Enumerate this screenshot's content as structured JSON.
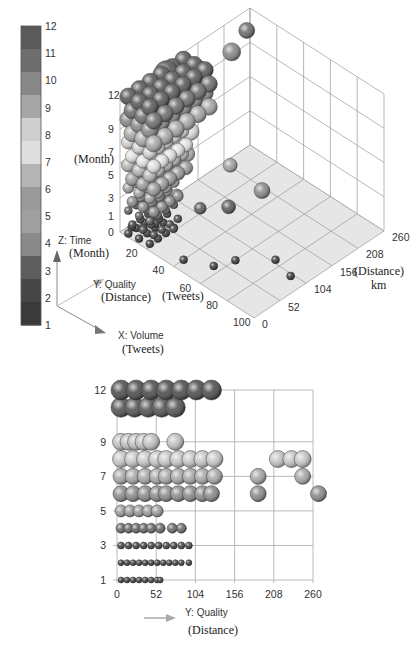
{
  "chart_data": [
    {
      "type": "scatter",
      "subtype": "3d-bubble",
      "title": "",
      "axes": {
        "x": {
          "name": "X: Volume",
          "unit_label": "(Tweets)",
          "ticks": [
            20,
            40,
            60,
            80,
            100
          ],
          "range": [
            0,
            100
          ]
        },
        "y": {
          "name": "Y: Quality",
          "unit_label": "(Distance)",
          "tick_unit": "km",
          "ticks": [
            0,
            52,
            104,
            156,
            208,
            260
          ],
          "range": [
            0,
            260
          ]
        },
        "z": {
          "name": "Z: Time",
          "unit_label": "(Month)",
          "ticks": [
            0,
            1,
            3,
            5,
            7,
            9,
            12
          ],
          "range": [
            0,
            12
          ]
        }
      },
      "axis_tick_labels": {
        "z": [
          "12",
          "9",
          "7",
          "5",
          "3",
          "1",
          "0"
        ],
        "x": [
          "20",
          "40",
          "60",
          "80",
          "100"
        ],
        "y": [
          "0",
          "52",
          "104",
          "156",
          "208",
          "260"
        ]
      },
      "legend": {
        "type": "colorbar",
        "position": "left",
        "ticks": [
          "12",
          "11",
          "10",
          "9",
          "8",
          "7",
          "6",
          "5",
          "4",
          "3",
          "2",
          "1"
        ],
        "colors": [
          "#5a5a5a",
          "#6e6e6e",
          "#888888",
          "#a6a6a6",
          "#cfcfcf",
          "#dedede",
          "#b4b4b4",
          "#9a9a9a",
          "#a0a0a0",
          "#8a8a8a",
          "#5e5e5e",
          "#464646",
          "#3a3a3a"
        ]
      },
      "grid": true,
      "points_approx": [
        {
          "x": 5,
          "y": 10,
          "z": 0.5,
          "size": 4
        },
        {
          "x": 10,
          "y": 20,
          "z": 0.5,
          "size": 4
        },
        {
          "x": 15,
          "y": 30,
          "z": 1,
          "size": 4
        },
        {
          "x": 25,
          "y": 40,
          "z": 1,
          "size": 4
        },
        {
          "x": 40,
          "y": 20,
          "z": 0,
          "size": 4
        },
        {
          "x": 55,
          "y": 40,
          "z": 0,
          "size": 4
        },
        {
          "x": 60,
          "y": 70,
          "z": 0,
          "size": 4
        },
        {
          "x": 75,
          "y": 110,
          "z": 0,
          "size": 4
        },
        {
          "x": 90,
          "y": 100,
          "z": 0,
          "size": 4
        },
        {
          "x": 10,
          "y": 30,
          "z": 3,
          "size": 6
        },
        {
          "x": 20,
          "y": 60,
          "z": 3,
          "size": 6
        },
        {
          "x": 30,
          "y": 80,
          "z": 2,
          "size": 6
        },
        {
          "x": 40,
          "y": 110,
          "z": 2,
          "size": 7
        },
        {
          "x": 50,
          "y": 150,
          "z": 3,
          "size": 8
        },
        {
          "x": 30,
          "y": 140,
          "z": 4,
          "size": 7
        },
        {
          "x": 15,
          "y": 50,
          "z": 5,
          "size": 8
        },
        {
          "x": 20,
          "y": 80,
          "z": 6,
          "size": 8
        },
        {
          "x": 10,
          "y": 40,
          "z": 7,
          "size": 9
        },
        {
          "x": 15,
          "y": 100,
          "z": 7,
          "size": 9
        },
        {
          "x": 10,
          "y": 40,
          "z": 11,
          "size": 12
        },
        {
          "x": 5,
          "y": 80,
          "z": 12,
          "size": 12
        },
        {
          "x": 10,
          "y": 130,
          "z": 11,
          "size": 11
        },
        {
          "x": 5,
          "y": 210,
          "z": 10,
          "size": 9
        },
        {
          "x": 5,
          "y": 240,
          "z": 11,
          "size": 8
        }
      ]
    },
    {
      "type": "scatter",
      "subtype": "2d-bubble-projection",
      "title": "",
      "xlabel": "Y: Quality",
      "xlabel_unit": "(Distance)",
      "ylabel": "",
      "xlim": [
        0,
        260
      ],
      "ylim": [
        1,
        12
      ],
      "x_ticks": [
        "0",
        "52",
        "104",
        "156",
        "208",
        "260"
      ],
      "y_ticks": [
        "1",
        "3",
        "5",
        "7",
        "9",
        "12"
      ],
      "grid": true,
      "rows": [
        {
          "z": 1,
          "size": 3,
          "color": "#3e3e3e",
          "x": [
            0,
            8,
            16,
            24,
            32,
            40,
            48,
            52
          ]
        },
        {
          "z": 2,
          "size": 3,
          "color": "#3e3e3e",
          "x": [
            0,
            8,
            16,
            24,
            32,
            40,
            48,
            56,
            64,
            72,
            80,
            90
          ]
        },
        {
          "z": 3,
          "size": 3.5,
          "color": "#444444",
          "x": [
            0,
            10,
            20,
            30,
            40,
            50,
            60,
            70,
            80,
            90
          ]
        },
        {
          "z": 4,
          "size": 5,
          "color": "#6a6a6a",
          "x": [
            0,
            10,
            20,
            30,
            40,
            52,
            68,
            80
          ]
        },
        {
          "z": 5,
          "size": 6,
          "color": "#9a9a9a",
          "x": [
            0,
            12,
            24,
            36,
            48
          ]
        },
        {
          "z": 6,
          "size": 8,
          "color": "#8c8c8c",
          "x": [
            0,
            16,
            32,
            48,
            60,
            76,
            92,
            108,
            120,
            182,
            262
          ]
        },
        {
          "z": 7,
          "size": 8,
          "color": "#a8a8a8",
          "x": [
            0,
            16,
            32,
            48,
            60,
            76,
            92,
            108,
            124,
            182,
            241
          ]
        },
        {
          "z": 8,
          "size": 8.5,
          "color": "#c6c6c6",
          "x": [
            0,
            16,
            32,
            48,
            60,
            76,
            92,
            108,
            124,
            208,
            226,
            241
          ]
        },
        {
          "z": 9,
          "size": 8.5,
          "color": "#c0c0c0",
          "x": [
            0,
            10,
            20,
            30,
            40,
            72
          ]
        },
        {
          "z": 11,
          "size": 10,
          "color": "#555555",
          "x": [
            0,
            18,
            36,
            54,
            72
          ]
        },
        {
          "z": 12,
          "size": 10,
          "color": "#4e4e4e",
          "x": [
            0,
            20,
            40,
            60,
            80,
            100,
            120
          ]
        }
      ]
    }
  ],
  "labels": {
    "z_axis_side_label": "(Month)",
    "y_axis_right_label": "(Distance)",
    "y_axis_right_unit": "km",
    "x_axis_bottom_label": "(Tweets)",
    "triad_z_name": "Z: Time",
    "triad_z_unit": "(Month)",
    "triad_y_name": "Y: Quality",
    "triad_y_unit": "(Distance)",
    "triad_x_name": "X: Volume",
    "triad_x_unit": "(Tweets)",
    "bottom_x_name": "Y: Quality",
    "bottom_x_unit": "(Distance)"
  },
  "colors": {
    "grid": "#9a9a9a",
    "floor": "#e6e6e6",
    "arrow": "#8a8a8a",
    "dark_bubble": "#4a4a4a",
    "light_bubble": "#d4d4d4"
  }
}
